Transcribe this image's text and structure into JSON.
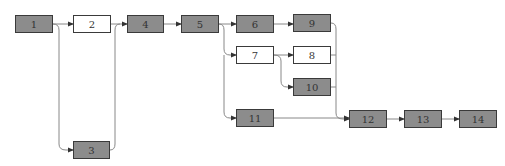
{
  "diagram": {
    "type": "network-flow",
    "colors": {
      "gray_fill": "#8c8c8c",
      "white_fill": "#ffffff",
      "border": "#3a3a3a",
      "edge": "#888888"
    },
    "nodes": [
      {
        "id": "1",
        "label": "1",
        "fill": "gray",
        "x": 15,
        "y": 15,
        "w": 38
      },
      {
        "id": "2",
        "label": "2",
        "fill": "white",
        "x": 73,
        "y": 15,
        "w": 38
      },
      {
        "id": "3",
        "label": "3",
        "fill": "gray",
        "x": 73,
        "y": 141,
        "w": 37
      },
      {
        "id": "4",
        "label": "4",
        "fill": "gray",
        "x": 127,
        "y": 15,
        "w": 37
      },
      {
        "id": "5",
        "label": "5",
        "fill": "gray",
        "x": 181,
        "y": 15,
        "w": 38
      },
      {
        "id": "6",
        "label": "6",
        "fill": "gray",
        "x": 236,
        "y": 15,
        "w": 38
      },
      {
        "id": "7",
        "label": "7",
        "fill": "white",
        "x": 236,
        "y": 46,
        "w": 38
      },
      {
        "id": "8",
        "label": "8",
        "fill": "white",
        "x": 293,
        "y": 46,
        "w": 38
      },
      {
        "id": "9",
        "label": "9",
        "fill": "gray",
        "x": 293,
        "y": 14,
        "w": 38
      },
      {
        "id": "10",
        "label": "10",
        "fill": "gray",
        "x": 293,
        "y": 78,
        "w": 38
      },
      {
        "id": "11",
        "label": "11",
        "fill": "gray",
        "x": 236,
        "y": 109,
        "w": 38
      },
      {
        "id": "12",
        "label": "12",
        "fill": "gray",
        "x": 349,
        "y": 110,
        "w": 38
      },
      {
        "id": "13",
        "label": "13",
        "fill": "gray",
        "x": 404,
        "y": 110,
        "w": 38
      },
      {
        "id": "14",
        "label": "14",
        "fill": "gray",
        "x": 459,
        "y": 110,
        "w": 38
      }
    ],
    "edges": [
      {
        "from": "1",
        "to": "2"
      },
      {
        "from": "1",
        "to": "3"
      },
      {
        "from": "2",
        "to": "4"
      },
      {
        "from": "3",
        "to": "4"
      },
      {
        "from": "4",
        "to": "5"
      },
      {
        "from": "5",
        "to": "6"
      },
      {
        "from": "5",
        "to": "7"
      },
      {
        "from": "5",
        "to": "11"
      },
      {
        "from": "6",
        "to": "9"
      },
      {
        "from": "7",
        "to": "8"
      },
      {
        "from": "7",
        "to": "10"
      },
      {
        "from": "9",
        "to": "12"
      },
      {
        "from": "8",
        "to": "12"
      },
      {
        "from": "10",
        "to": "12"
      },
      {
        "from": "11",
        "to": "12"
      },
      {
        "from": "12",
        "to": "13"
      },
      {
        "from": "13",
        "to": "14"
      }
    ]
  }
}
